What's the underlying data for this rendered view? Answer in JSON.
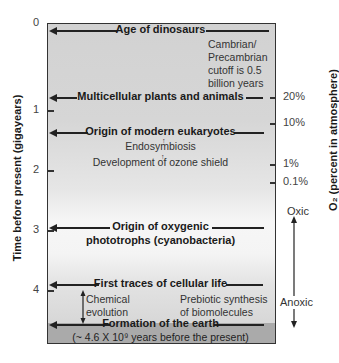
{
  "left_axis": {
    "title": "Time before present (gigayears)",
    "ticks": [
      "0",
      "1",
      "2",
      "3",
      "4"
    ]
  },
  "right_axis": {
    "title": "O₂ (percent in atmosphere)",
    "ticks": [
      "20%",
      "10%",
      "1%",
      "0.1%"
    ],
    "oxic_label": "Oxic",
    "anoxic_label": "Anoxic"
  },
  "events": {
    "dinosaurs": "Age of dinosaurs",
    "multicellular": "Multicellular plants and animals",
    "eukaryotes": "Origin of modern eukaryotes",
    "oxygenic_line1": "Origin of oxygenic",
    "oxygenic_line2": "phototrophs (cyanobacteria)",
    "cellular_life": "First traces of cellular life",
    "earth_line1": "Formation of the earth",
    "earth_line2": "(~ 4.6 X 10⁹ years before the present)"
  },
  "notes": {
    "cambrian": [
      "Cambrian/",
      "Precambrian",
      "cutoff is 0.5",
      "billion years"
    ],
    "endosymbiosis": "Endosymbiosis",
    "ozone": "Development of ozone shield",
    "chemical_evolution": [
      "Chemical",
      "evolution"
    ],
    "prebiotic": [
      "Prebiotic synthesis",
      "of biomolecules"
    ]
  },
  "colors": {
    "box_top": "#d2d2d2",
    "box_light": "#f6f6f6",
    "box_bottom_strip": "#aaaaaa",
    "ink": "#1a1a1a"
  }
}
